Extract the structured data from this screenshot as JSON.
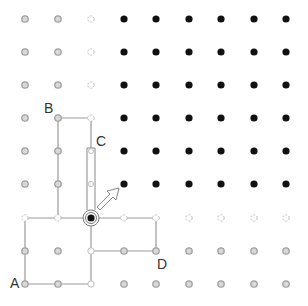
{
  "diagram": {
    "grid": {
      "cols": 9,
      "rows": 9,
      "x": [
        25,
        58,
        91,
        124,
        156,
        189,
        221,
        254,
        286
      ],
      "y": [
        19,
        52,
        85,
        118,
        151,
        184,
        218,
        251,
        284
      ]
    },
    "colors": {
      "black_dot": "#111111",
      "gray_dot": "#a0a0a0",
      "dashed_dot": "#bbbbbb",
      "line": "#999999"
    },
    "labels": [
      {
        "text": "A",
        "col": 0,
        "row": 8
      },
      {
        "text": "B",
        "col": 1,
        "row": 3
      },
      {
        "text": "C",
        "col": 2,
        "row": 4
      },
      {
        "text": "D",
        "col": 4,
        "row": 7
      }
    ],
    "current_point": {
      "col": 2,
      "row": 6
    },
    "arrows": [
      {
        "name": "up-arrow",
        "direction": "north"
      },
      {
        "name": "diagonal-arrow",
        "direction": "north-east"
      }
    ]
  }
}
